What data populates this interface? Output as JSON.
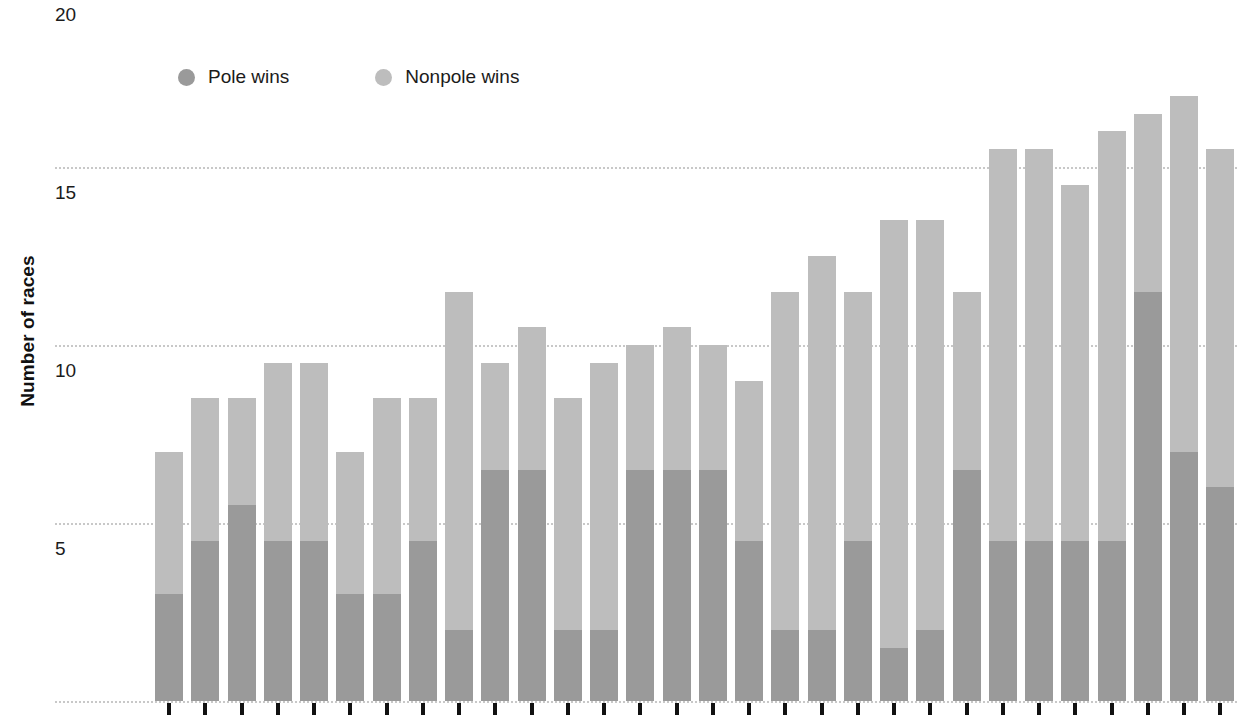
{
  "chart_data": {
    "type": "bar",
    "subtype": "stacked",
    "title": "",
    "xlabel": "",
    "ylabel": "Number of races",
    "ylim": [
      0,
      20
    ],
    "y_ticks": [
      5,
      10,
      15,
      20
    ],
    "grid": true,
    "legend_position": "top-left",
    "categories": [
      "1",
      "2",
      "3",
      "4",
      "5",
      "6",
      "7",
      "8",
      "9",
      "10",
      "11",
      "12",
      "13",
      "14",
      "15",
      "16",
      "17",
      "18",
      "19",
      "20",
      "21",
      "22",
      "23",
      "24",
      "25",
      "26",
      "27",
      "28",
      "29",
      "30"
    ],
    "series": [
      {
        "name": "Pole wins",
        "color": "#9a9a9a",
        "values": [
          3,
          4.5,
          5.5,
          4.5,
          4.5,
          3,
          3,
          4.5,
          2,
          6.5,
          6.5,
          2,
          2,
          6.5,
          6.5,
          6.5,
          4.5,
          2,
          2,
          4.5,
          1.5,
          2,
          6.5,
          4.5,
          4.5,
          4.5,
          4.5,
          11.5,
          7,
          6
        ]
      },
      {
        "name": "Nonpole wins",
        "color": "#bdbdbd",
        "values": [
          4,
          4,
          3,
          5,
          5,
          4,
          5.5,
          4,
          9.5,
          3,
          4,
          6.5,
          7.5,
          3.5,
          4,
          3.5,
          4.5,
          9.5,
          10.5,
          7,
          12,
          11.5,
          5,
          11,
          11,
          10,
          11.5,
          5,
          10,
          9.5
        ]
      }
    ],
    "totals": [
      7,
      8.5,
      8.5,
      9.5,
      9.5,
      7,
      8.5,
      8.5,
      11.5,
      9.5,
      10.5,
      8.5,
      9.5,
      10,
      10.5,
      10,
      9,
      11.5,
      12.5,
      11.5,
      13.5,
      13.5,
      11.5,
      15.5,
      15.5,
      14.5,
      16,
      16.5,
      17,
      15.5
    ]
  },
  "axis": {
    "y_title": "Number of races",
    "y_labels": [
      "20",
      "15",
      "10",
      "5"
    ]
  },
  "legend": {
    "items": [
      {
        "label": "Pole wins",
        "color": "#9a9a9a",
        "icon": "circle-swatch-icon"
      },
      {
        "label": "Nonpole wins",
        "color": "#bdbdbd",
        "icon": "circle-swatch-icon"
      }
    ]
  },
  "colors": {
    "pole": "#9a9a9a",
    "nonpole": "#bdbdbd",
    "grid": "#c8c8c8",
    "tick": "#111111",
    "text": "#1b1b1b",
    "background": "#ffffff"
  }
}
